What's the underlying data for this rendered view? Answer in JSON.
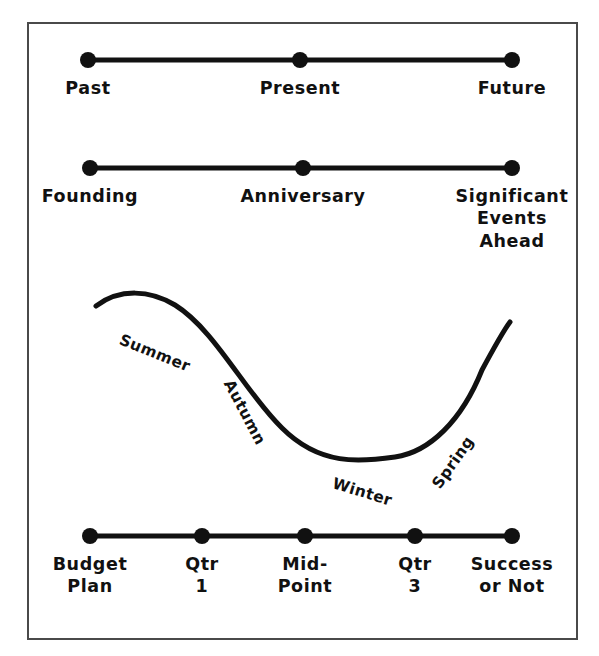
{
  "frame": {
    "border_color": "#4a4a4a",
    "background_color": "#ffffff"
  },
  "style": {
    "ink_color": "#111111",
    "line_width": 5,
    "dot_radius": 8
  },
  "timelines": [
    {
      "name": "past-present-future",
      "y_line": 60,
      "x_start": 88,
      "x_end": 512,
      "points": [
        {
          "label": "Past",
          "x": 88
        },
        {
          "label": "Present",
          "x": 300
        },
        {
          "label": "Future",
          "x": 512
        }
      ]
    },
    {
      "name": "founding-anniversary-events",
      "y_line": 168,
      "x_start": 90,
      "x_end": 512,
      "points": [
        {
          "label": "Founding",
          "x": 90
        },
        {
          "label": "Anniversary",
          "x": 303
        },
        {
          "label": "Significant\nEvents\nAhead",
          "x": 512
        }
      ]
    },
    {
      "name": "budget-to-success",
      "y_line": 536,
      "x_start": 90,
      "x_end": 512,
      "points": [
        {
          "label": "Budget\nPlan",
          "x": 90
        },
        {
          "label": "Qtr\n1",
          "x": 202
        },
        {
          "label": "Mid-\nPoint",
          "x": 305
        },
        {
          "label": "Qtr\n3",
          "x": 415
        },
        {
          "label": "Success\nor Not",
          "x": 512
        }
      ]
    }
  ],
  "season_curve": {
    "name": "seasonal-wave",
    "labels": [
      {
        "text": "Summer",
        "x": 120,
        "y": 330,
        "rotate": 22
      },
      {
        "text": "Autumn",
        "x": 228,
        "y": 372,
        "rotate": 62
      },
      {
        "text": "Winter",
        "x": 333,
        "y": 474,
        "rotate": 17
      },
      {
        "text": "Spring",
        "x": 436,
        "y": 478,
        "rotate": -55
      }
    ],
    "path": "M 96 306 C 120 288 150 290 175 305 C 215 330 245 392 282 428 C 320 466 360 462 395 457 C 430 452 462 420 482 370 C 496 344 504 330 510 322"
  },
  "chart_data": {
    "type": "line",
    "title": "",
    "xlabel": "",
    "ylabel": "",
    "annotations": [
      "Summer",
      "Autumn",
      "Winter",
      "Spring"
    ],
    "x": [
      0,
      1,
      2,
      3,
      4,
      5,
      6
    ],
    "values": [
      306,
      296,
      330,
      420,
      457,
      400,
      322
    ],
    "grid": false,
    "legend_position": "none"
  }
}
